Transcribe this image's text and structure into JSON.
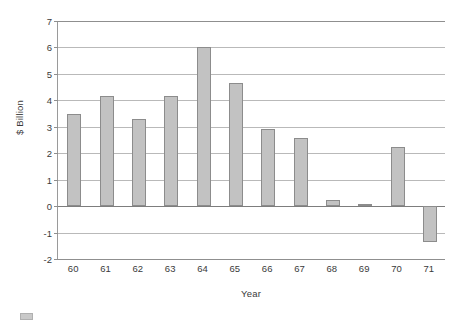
{
  "chart_data": {
    "type": "bar",
    "title": "",
    "xlabel": "Year",
    "ylabel": "$ Billion",
    "categories": [
      "60",
      "61",
      "62",
      "63",
      "64",
      "65",
      "66",
      "67",
      "68",
      "69",
      "70",
      "71"
    ],
    "values": [
      3.5,
      4.18,
      3.3,
      4.18,
      6.0,
      4.65,
      2.9,
      2.58,
      0.25,
      0.07,
      2.22,
      -1.35
    ],
    "series": [
      {
        "name": "",
        "values": [
          3.5,
          4.18,
          3.3,
          4.18,
          6.0,
          4.65,
          2.9,
          2.58,
          0.25,
          0.07,
          2.22,
          -1.35
        ]
      }
    ],
    "ylim": [
      -2,
      7
    ],
    "ytick_labels": [
      "7",
      "6",
      "5",
      "4",
      "3",
      "2",
      "1",
      "0",
      "-1",
      "-2"
    ],
    "ytick_values": [
      7,
      6,
      5,
      4,
      3,
      2,
      1,
      0,
      -1,
      -2
    ],
    "xtick_labels": [
      "60",
      "61",
      "62",
      "63",
      "64",
      "65",
      "66",
      "67",
      "68",
      "69",
      "70",
      "71"
    ],
    "grid": true,
    "grid_axis": "y",
    "legend": false,
    "legend_position": "bottom-left",
    "bar_color": "#c2c2c2",
    "bar_border_color": "#8c8c8c",
    "grid_color": "#b9b9b9",
    "axis_color": "#8f8f8f",
    "zero_line_color": "#7d7d7d",
    "text_color": "#3a3a3a",
    "background_color": "#ffffff"
  }
}
